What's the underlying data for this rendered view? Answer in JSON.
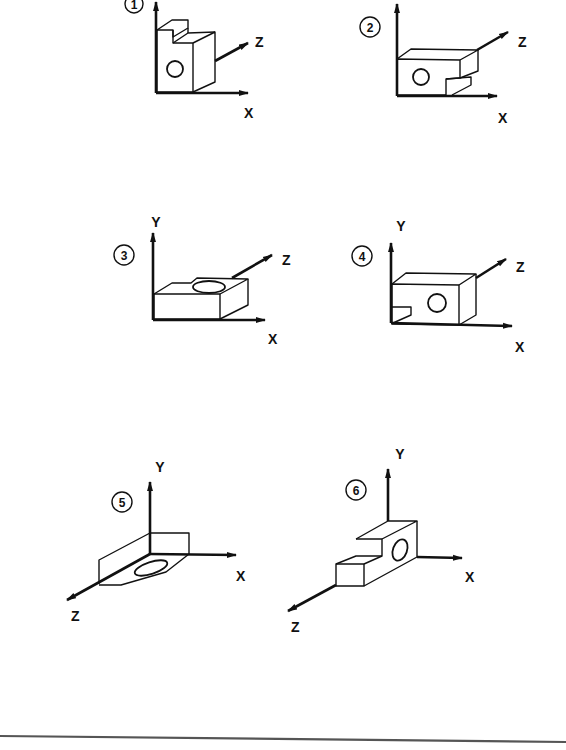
{
  "diagram": {
    "type": "isometric-orientation-views",
    "views": [
      {
        "number": "1",
        "axes": [
          "X",
          "Z"
        ],
        "description": "upright block with stepped top, hole on front face"
      },
      {
        "number": "2",
        "axes": [
          "X",
          "Z"
        ],
        "description": "block lying on side, hole on front face, notch at lower right"
      },
      {
        "number": "3",
        "axes": [
          "Y",
          "X",
          "Z"
        ],
        "description": "block lying flat, hole on top face"
      },
      {
        "number": "4",
        "axes": [
          "Y",
          "X",
          "Z"
        ],
        "description": "block with hole on front face, notch at lower left"
      },
      {
        "number": "5",
        "axes": [
          "Y",
          "X",
          "Z"
        ],
        "description": "flat plate along Z with hole, upright tab"
      },
      {
        "number": "6",
        "axes": [
          "Y",
          "X",
          "Z"
        ],
        "description": "stepped block along Z, hole on end face"
      }
    ]
  },
  "labels": {
    "x": "X",
    "y": "Y",
    "z": "Z",
    "v1": "1",
    "v2": "2",
    "v3": "3",
    "v4": "4",
    "v5": "5",
    "v6": "6"
  }
}
